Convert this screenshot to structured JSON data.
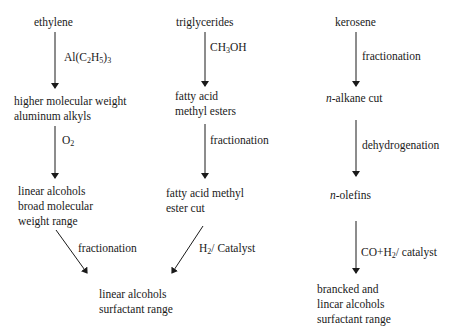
{
  "diagram": {
    "columns": [
      {
        "nodes": [
          {
            "lines": [
              "ethylene"
            ]
          },
          {
            "lines": [
              "higher molecular weight",
              "aluminum alkyls"
            ]
          },
          {
            "lines": [
              "linear alcohols",
              "broad molecular",
              "weight range"
            ]
          }
        ],
        "edges": [
          {
            "label_prefix": "Al(C",
            "sub1": "2",
            "mid": "H",
            "sub2": "5",
            "suffix": ")",
            "sub3": "3"
          },
          {
            "label_prefix": "O",
            "sub1": "2"
          },
          {
            "label": "fractionation"
          }
        ]
      },
      {
        "nodes": [
          {
            "lines": [
              "triglycerides"
            ]
          },
          {
            "lines": [
              "fatty acid",
              "methyl esters"
            ]
          },
          {
            "lines": [
              "fatty acid methyl",
              "ester cut"
            ]
          }
        ],
        "edges": [
          {
            "label_prefix": "CH",
            "sub1": "3",
            "suffix": "OH"
          },
          {
            "label": "fractionation"
          },
          {
            "label_prefix": "H",
            "sub1": "2",
            "suffix": "/ Catalyst"
          }
        ]
      },
      {
        "nodes": [
          {
            "lines": [
              "kerosene"
            ]
          },
          {
            "italic_prefix": "n",
            "text": "-alkane cut"
          },
          {
            "italic_prefix": "n",
            "text": "-olefins"
          },
          {
            "lines": [
              "brancked and",
              "lincar alcohols",
              "surfactant range"
            ]
          }
        ],
        "edges": [
          {
            "label": "fractionation"
          },
          {
            "label": "dehydrogenation"
          },
          {
            "label_prefix": "CO+H",
            "sub1": "2",
            "suffix": "/ catalyst"
          }
        ]
      }
    ],
    "merge_node": {
      "lines": [
        "linear alcohols",
        "surfactant range"
      ]
    },
    "line_color": "#1a1a1a"
  }
}
